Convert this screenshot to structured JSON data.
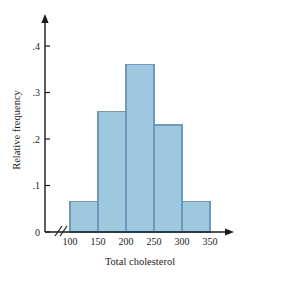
{
  "chart_data": {
    "type": "bar",
    "title": "",
    "subtitle": "",
    "xlabel": "Total cholesterol",
    "ylabel": "Relative frequency",
    "categories": [
      "100-150",
      "150-200",
      "200-250",
      "250-300",
      "300-350"
    ],
    "bin_edges": [
      100,
      150,
      200,
      250,
      300,
      350
    ],
    "values": [
      0.065,
      0.26,
      0.36,
      0.23,
      0.065
    ],
    "x_tick_labels": [
      "100",
      "150",
      "200",
      "250",
      "300",
      "350"
    ],
    "x_tick_values": [
      100,
      150,
      200,
      250,
      300,
      350
    ],
    "y_tick_labels": [
      "0",
      ".1",
      ".2",
      ".3",
      ".4"
    ],
    "y_tick_values": [
      0,
      0.1,
      0.2,
      0.3,
      0.4
    ],
    "xlim": [
      100,
      350
    ],
    "ylim": [
      0,
      0.45
    ],
    "grid": false,
    "legend": false,
    "legend_position": "none",
    "axis_break": "//",
    "annotations": []
  },
  "style": {
    "bar_fill": "#9dc8e0",
    "bar_stroke": "#6a9bbf",
    "axis_color": "#1b1b1b",
    "background": "#ffffff"
  }
}
